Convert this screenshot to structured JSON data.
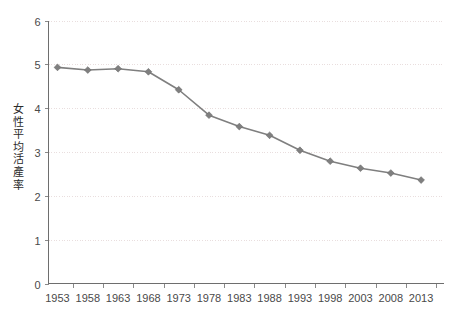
{
  "chart_data": {
    "type": "line",
    "title": "",
    "subtitle": "",
    "xlabel": "",
    "ylabel": "女性平均活產率",
    "categories": [
      "1953",
      "1958",
      "1963",
      "1968",
      "1973",
      "1978",
      "1983",
      "1988",
      "1993",
      "1998",
      "2003",
      "2008",
      "2013"
    ],
    "values": [
      4.93,
      4.87,
      4.9,
      4.83,
      4.42,
      3.84,
      3.58,
      3.38,
      3.04,
      2.79,
      2.63,
      2.52,
      2.36
    ],
    "series": [
      {
        "name": "女性平均活產率",
        "values": [
          4.93,
          4.87,
          4.9,
          4.83,
          4.42,
          3.84,
          3.58,
          3.38,
          3.04,
          2.79,
          2.63,
          2.52,
          2.36
        ],
        "color": "#7f7f7f",
        "marker": "diamond"
      }
    ],
    "ylim": [
      0,
      6
    ],
    "yticks": [
      "0",
      "1",
      "2",
      "3",
      "4",
      "5",
      "6"
    ],
    "ytick_values": [
      0,
      1,
      2,
      3,
      4,
      5,
      6
    ],
    "grid": "horizontal-dotted",
    "legend": "none",
    "annotations": []
  },
  "axis": {
    "y_title": "女性平均活產率",
    "y_tick_labels": [
      "6",
      "5",
      "4",
      "3",
      "2",
      "1",
      "0"
    ],
    "x_tick_labels": [
      "1953",
      "1958",
      "1963",
      "1968",
      "1973",
      "1978",
      "1983",
      "1988",
      "1993",
      "1998",
      "2003",
      "2008",
      "2013"
    ]
  },
  "colors": {
    "background": "#ffffff",
    "series": "#7f7f7f",
    "gridline": "#e9dede",
    "axis": "#6e6e6e",
    "tick_text": "#4a4a4a",
    "title_text": "#2b2b2b"
  }
}
